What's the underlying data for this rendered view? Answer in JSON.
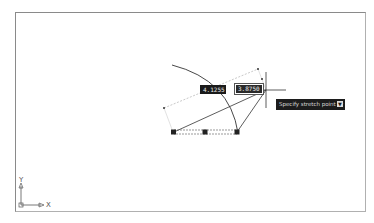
{
  "canvas": {
    "background": "#ffffff",
    "frame_color": "#8a8a8a"
  },
  "dimensions": {
    "length_value": "4.1255",
    "angle_value": "3.8750"
  },
  "tooltip": {
    "prompt": "Specify stretch point or",
    "dropdown_icon": "down-arrow-icon"
  },
  "ucs": {
    "x_label": "X",
    "y_label": "Y"
  },
  "cursor": {
    "type": "crosshair",
    "x": 266,
    "y": 90
  }
}
